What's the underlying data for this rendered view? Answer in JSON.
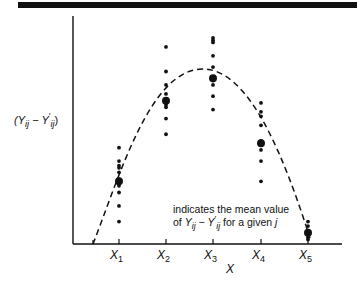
{
  "chart_data": {
    "type": "scatter",
    "title": "",
    "xlabel": "X",
    "ylabel": "(Y_ij − Y'_ij)",
    "categories": [
      "X1",
      "X2",
      "X3",
      "X4",
      "X5"
    ],
    "grid": false,
    "legend": null,
    "annotation": "indicates the mean value of Y_ij − Y'_ij for a given j",
    "series": [
      {
        "name": "observations (relative vertical position, 0=baseline, 100=top)",
        "points": {
          "X1": [
            43,
            37,
            35,
            34,
            32,
            29,
            26,
            23,
            17,
            10
          ],
          "X2": [
            88,
            77,
            71,
            67,
            62,
            61,
            56,
            49
          ],
          "X3": [
            92,
            91,
            90,
            84,
            79,
            73,
            71,
            66,
            60
          ],
          "X4": [
            63,
            59,
            57,
            53,
            46,
            42,
            37,
            28
          ],
          "X5": [
            10,
            8,
            6,
            5,
            3,
            2
          ]
        }
      },
      {
        "name": "group means",
        "values": [
          28,
          64,
          74,
          45,
          5
        ]
      },
      {
        "name": "fitted curve (dashed, quadratic)",
        "style": "dashed",
        "shape": "inverted parabola peaking between X2 and X3, crossing baseline left of X1 and near X5"
      }
    ]
  },
  "labels": {
    "ylabel_text": "(Y",
    "ylabel_sub1": "ij",
    "ylabel_minus": " − Y",
    "ylabel_sup": "′",
    "ylabel_sub2": "ij",
    "ylabel_close": ")",
    "xlabel": "X",
    "x_ticks": [
      {
        "base": "X",
        "sub": "1"
      },
      {
        "base": "X",
        "sub": "2"
      },
      {
        "base": "X",
        "sub": "3"
      },
      {
        "base": "X",
        "sub": "4"
      },
      {
        "base": "X",
        "sub": "5"
      }
    ],
    "note_line1": "indicates the mean value",
    "note_line2_pre": "of ",
    "note_y1": "Y",
    "note_sub1": "ij",
    "note_minus": " − ",
    "note_y2": "Y",
    "note_sup": "′",
    "note_sub2": "ij",
    "note_post": " for a given ",
    "note_j": "j"
  }
}
